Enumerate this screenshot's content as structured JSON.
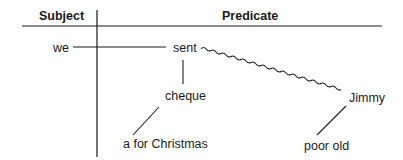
{
  "header": {
    "subject": "Subject",
    "predicate": "Predicate"
  },
  "words": {
    "subject": "we",
    "verb": "sent",
    "direct_object": "cheque",
    "direct_object_modifiers": "a for Christmas",
    "indirect_object": "Jimmy",
    "indirect_object_modifiers": "poor old"
  },
  "colors": {
    "line": "#1a1a1a",
    "text": "#1a1a1a",
    "background": "#ffffff"
  }
}
